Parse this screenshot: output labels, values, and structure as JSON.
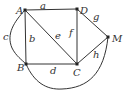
{
  "diagram": {
    "type": "graph",
    "vertices": [
      {
        "id": "A",
        "label": "A",
        "x": 25,
        "y": 10
      },
      {
        "id": "D",
        "label": "D",
        "x": 77,
        "y": 9
      },
      {
        "id": "M",
        "label": "M",
        "x": 108,
        "y": 37
      },
      {
        "id": "B",
        "label": "B",
        "x": 26,
        "y": 64
      },
      {
        "id": "C",
        "label": "C",
        "x": 77,
        "y": 64
      }
    ],
    "edges": [
      {
        "id": "a",
        "label": "a",
        "from": "A",
        "to": "D"
      },
      {
        "id": "b",
        "label": "b",
        "from": "A",
        "to": "B"
      },
      {
        "id": "c",
        "label": "c",
        "from": "A",
        "to": "B",
        "curved": true
      },
      {
        "id": "d",
        "label": "d",
        "from": "B",
        "to": "C"
      },
      {
        "id": "e",
        "label": "e",
        "from": "A",
        "to": "C"
      },
      {
        "id": "f",
        "label": "f",
        "from": "D",
        "to": "C"
      },
      {
        "id": "g",
        "label": "g",
        "from": "D",
        "to": "M"
      },
      {
        "id": "h",
        "label": "h",
        "from": "C",
        "to": "M"
      },
      {
        "id": "bm",
        "label": "",
        "from": "B",
        "to": "M",
        "curved": true
      }
    ]
  }
}
